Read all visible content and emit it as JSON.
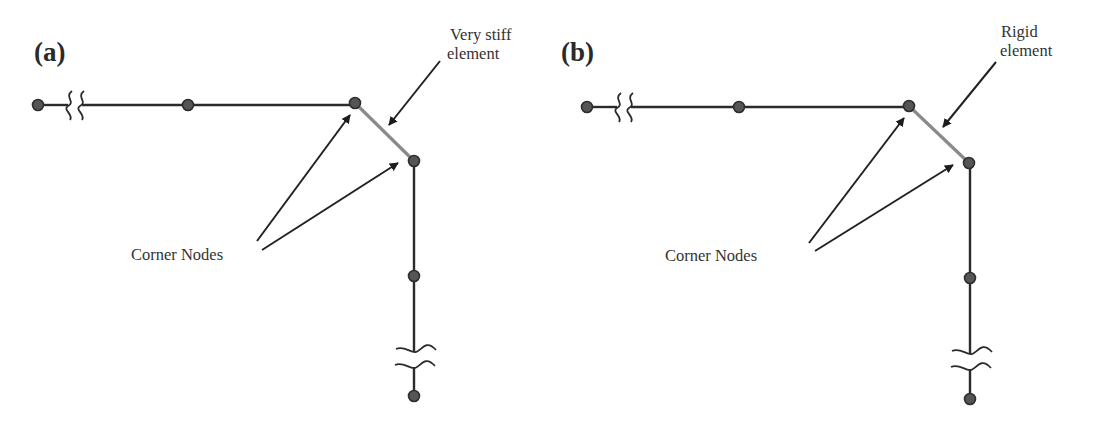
{
  "figure": {
    "panels": [
      {
        "id": "a",
        "label": "(a)",
        "connector_label_line1": "Very stiff",
        "connector_label_line2": "element",
        "corner_label": "Corner Nodes",
        "connector_type": "very-stiff-element"
      },
      {
        "id": "b",
        "label": "(b)",
        "connector_label_line1": "Rigid",
        "connector_label_line2": "element",
        "corner_label": "Corner Nodes",
        "connector_type": "rigid-element"
      }
    ],
    "colors": {
      "member": "#2b2b2b",
      "connector_element": "#8a8a8a",
      "node_fill": "#555555",
      "arrow": "#1c1c1c",
      "text": "#333333"
    }
  }
}
